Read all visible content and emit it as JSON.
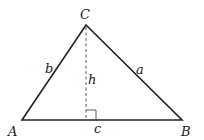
{
  "diagram": {
    "type": "triangle-with-altitude",
    "vertices": {
      "A": {
        "label": "A",
        "x": 22,
        "y": 120
      },
      "B": {
        "label": "B",
        "x": 182,
        "y": 120
      },
      "C": {
        "label": "C",
        "x": 86,
        "y": 25
      }
    },
    "sides": {
      "a": {
        "label": "a"
      },
      "b": {
        "label": "b"
      },
      "c": {
        "label": "c"
      }
    },
    "altitude": {
      "label": "h",
      "foot": {
        "x": 86,
        "y": 120
      },
      "style": "dashed"
    },
    "right_angle_marker": true,
    "colors": {
      "stroke": "#222222",
      "background": "#ffffff"
    }
  }
}
